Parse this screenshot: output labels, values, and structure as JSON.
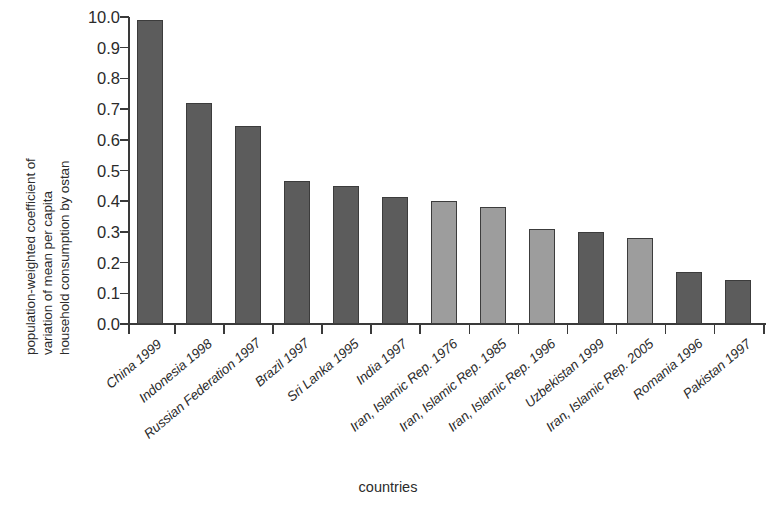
{
  "chart_data": {
    "type": "bar",
    "title": "",
    "xlabel": "countries",
    "ylabel": "population-weighted coefficient of variation of mean per capita household consumption by ostan",
    "ylabel_lines": [
      "population-weighted coefficient of",
      "variation of mean per capita",
      "household consumption by ostan"
    ],
    "ylim": [
      0.0,
      1.0
    ],
    "ytick_labels": [
      "10.0",
      "0.9",
      "0.8",
      "0.7",
      "0.6",
      "0.5",
      "0.4",
      "0.3",
      "0.2",
      "0.1",
      "0.0"
    ],
    "ytick_values": [
      1.0,
      0.9,
      0.8,
      0.7,
      0.6,
      0.5,
      0.4,
      0.3,
      0.2,
      0.1,
      0.0
    ],
    "grid": false,
    "legend": "none",
    "categories": [
      "China 1999",
      "Indonesia 1998",
      "Russian Federation 1997",
      "Brazil 1997",
      "Sri Lanka 1995",
      "India 1997",
      "Iran, Islamic Rep. 1976",
      "Iran, Islamic Rep. 1985",
      "Iran, Islamic Rep. 1996",
      "Uzbekistan 1999",
      "Iran, Islamic Rep. 2005",
      "Romania 1996",
      "Pakistan 1997"
    ],
    "values": [
      0.99,
      0.72,
      0.645,
      0.465,
      0.45,
      0.415,
      0.4,
      0.38,
      0.31,
      0.3,
      0.28,
      0.17,
      0.145
    ],
    "bar_colors": [
      "#5c5c5c",
      "#5c5c5c",
      "#5c5c5c",
      "#5c5c5c",
      "#5c5c5c",
      "#5c5c5c",
      "#9d9d9d",
      "#9d9d9d",
      "#9d9d9d",
      "#5c5c5c",
      "#9d9d9d",
      "#5c5c5c",
      "#5c5c5c"
    ],
    "highlight_color": "#9d9d9d",
    "default_color": "#5c5c5c",
    "bar_edge_color": "#3c3c3c"
  }
}
